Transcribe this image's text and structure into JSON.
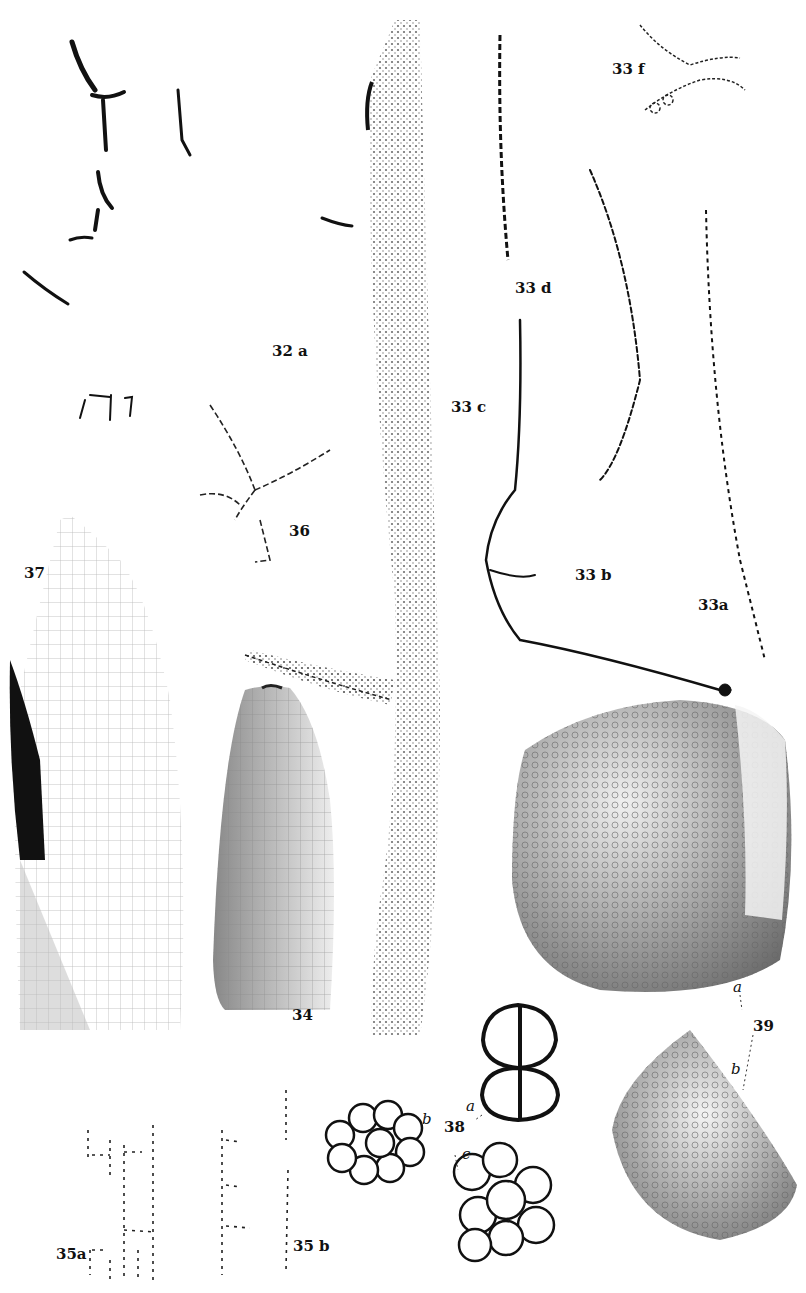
{
  "plate": {
    "type": "scientific illustration plate",
    "background": "#ffffff",
    "ink": "#111111"
  },
  "figures": [
    {
      "id": "32a",
      "label": "32 a"
    },
    {
      "id": "33a",
      "label": "33a"
    },
    {
      "id": "33b",
      "label": "33 b"
    },
    {
      "id": "33c",
      "label": "33 c"
    },
    {
      "id": "33d",
      "label": "33 d"
    },
    {
      "id": "33f",
      "label": "33 f"
    },
    {
      "id": "34",
      "label": "34"
    },
    {
      "id": "35a",
      "label": "35a"
    },
    {
      "id": "35b",
      "label": "35 b"
    },
    {
      "id": "36",
      "label": "36"
    },
    {
      "id": "37",
      "label": "37"
    },
    {
      "id": "38",
      "label": "38"
    },
    {
      "id": "38a",
      "label": "a"
    },
    {
      "id": "38b",
      "label": "b"
    },
    {
      "id": "38c",
      "label": "c"
    },
    {
      "id": "39",
      "label": "39"
    },
    {
      "id": "39a",
      "label": "a"
    },
    {
      "id": "39b",
      "label": "b"
    }
  ]
}
